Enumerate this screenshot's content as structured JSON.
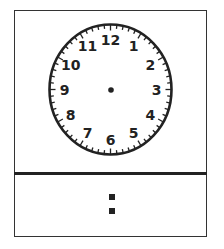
{
  "clock": {
    "numbers": [
      "12",
      "1",
      "2",
      "3",
      "4",
      "5",
      "6",
      "7",
      "8",
      "9",
      "10",
      "11"
    ],
    "center_dot": true,
    "hands": []
  },
  "digital": {
    "hours": "",
    "separator": ":",
    "minutes": ""
  },
  "colors": {
    "stroke": "#222222",
    "background": "#ffffff"
  }
}
